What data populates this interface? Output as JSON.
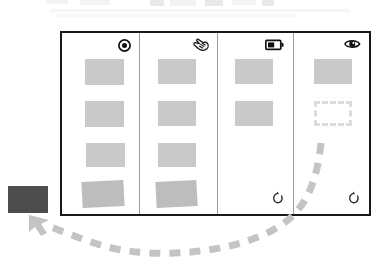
{
  "scene": {
    "title": "Storyboard: four-panel interaction sequence",
    "background_color": "#ffffff",
    "frame_border_color": "#191919",
    "divider_color": "#9a9a9a",
    "card_color": "#c9c9c9",
    "placeholder_color": "#dcdcdc",
    "arrow_color": "#c4c4c4",
    "swatch_color": "#4d4d4d"
  },
  "frame": {
    "x": 60,
    "y": 31,
    "width": 311,
    "height": 185,
    "panel_count": 4
  },
  "panels": [
    {
      "index": 1,
      "name": "panel-record",
      "icon": "record-target-icon",
      "icon_label": "record",
      "card_count": 4,
      "has_undo": false,
      "has_placeholder": false,
      "cards": [
        {
          "name": "card",
          "x": 23,
          "y": 26,
          "w": 39,
          "h": 26,
          "tilt": 0,
          "shade": "light"
        },
        {
          "name": "card",
          "x": 23,
          "y": 68,
          "w": 39,
          "h": 26,
          "tilt": 0,
          "shade": "light"
        },
        {
          "name": "card",
          "x": 24,
          "y": 110,
          "w": 39,
          "h": 24,
          "tilt": 0,
          "shade": "light"
        },
        {
          "name": "card",
          "x": 20,
          "y": 148,
          "w": 42,
          "h": 26,
          "tilt": -3,
          "shade": "dark"
        }
      ]
    },
    {
      "index": 2,
      "name": "panel-hand",
      "icon": "hand-grab-icon",
      "icon_label": "hand",
      "card_count": 4,
      "has_undo": false,
      "has_placeholder": false,
      "cards": [
        {
          "name": "card",
          "x": 18,
          "y": 26,
          "w": 38,
          "h": 25,
          "tilt": 0,
          "shade": "light"
        },
        {
          "name": "card",
          "x": 18,
          "y": 68,
          "w": 38,
          "h": 25,
          "tilt": 0,
          "shade": "light"
        },
        {
          "name": "card",
          "x": 18,
          "y": 110,
          "w": 38,
          "h": 24,
          "tilt": 0,
          "shade": "light"
        },
        {
          "name": "card",
          "x": 16,
          "y": 148,
          "w": 41,
          "h": 26,
          "tilt": -2,
          "shade": "dark"
        }
      ]
    },
    {
      "index": 3,
      "name": "panel-battery",
      "icon": "battery-icon",
      "icon_label": "battery",
      "card_count": 2,
      "has_undo": true,
      "has_placeholder": false,
      "cards": [
        {
          "name": "card",
          "x": 17,
          "y": 26,
          "w": 38,
          "h": 25,
          "tilt": 0,
          "shade": "light"
        },
        {
          "name": "card",
          "x": 17,
          "y": 68,
          "w": 38,
          "h": 25,
          "tilt": 0,
          "shade": "light"
        }
      ]
    },
    {
      "index": 4,
      "name": "panel-eye",
      "icon": "eye-icon",
      "icon_label": "eye",
      "card_count": 1,
      "has_undo": true,
      "has_placeholder": true,
      "cards": [
        {
          "name": "card",
          "x": 20,
          "y": 26,
          "w": 38,
          "h": 25,
          "tilt": 0,
          "shade": "light"
        }
      ],
      "placeholder": {
        "name": "card-placeholder",
        "x": 20,
        "y": 68,
        "w": 38,
        "h": 25
      }
    }
  ],
  "swatch": {
    "name": "extracted-card-swatch",
    "x": 8,
    "y": 186,
    "width": 40,
    "height": 27,
    "color": "#4d4d4d"
  },
  "arrow": {
    "name": "dashed-flow-arrow",
    "color": "#c4c4c4",
    "dash": "11 9",
    "stroke_width": 7,
    "from": "panel-4-placeholder",
    "to": "extracted-card-swatch",
    "head": "arrowhead-up-left"
  },
  "icons": {
    "record": "record-target-icon",
    "hand": "hand-grab-icon",
    "battery": "battery-icon",
    "eye": "eye-icon",
    "undo": "undo-arrow-icon"
  }
}
